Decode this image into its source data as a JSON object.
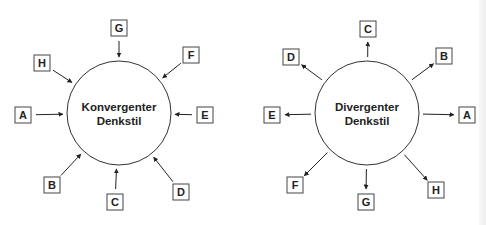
{
  "diagrams": [
    {
      "id": "convergent",
      "title_line1": "Konvergenter",
      "title_line2": "Denkstil",
      "direction": "inward",
      "center": [
        119,
        113
      ],
      "radius": 52,
      "nodes": [
        {
          "label": "A",
          "box": [
            15,
            107
          ]
        },
        {
          "label": "B",
          "box": [
            44,
            177
          ]
        },
        {
          "label": "C",
          "box": [
            107,
            194
          ]
        },
        {
          "label": "D",
          "box": [
            173,
            184
          ]
        },
        {
          "label": "E",
          "box": [
            197,
            107
          ]
        },
        {
          "label": "F",
          "box": [
            183,
            47
          ]
        },
        {
          "label": "G",
          "box": [
            111,
            20
          ]
        },
        {
          "label": "H",
          "box": [
            34,
            55
          ]
        }
      ]
    },
    {
      "id": "divergent",
      "title_line1": "Divergenter",
      "title_line2": "Denkstil",
      "direction": "outward",
      "center": [
        367,
        113
      ],
      "radius": 52,
      "nodes": [
        {
          "label": "A",
          "box": [
            459,
            107
          ]
        },
        {
          "label": "B",
          "box": [
            436,
            48
          ]
        },
        {
          "label": "C",
          "box": [
            360,
            21
          ]
        },
        {
          "label": "D",
          "box": [
            283,
            49
          ]
        },
        {
          "label": "E",
          "box": [
            264,
            107
          ]
        },
        {
          "label": "F",
          "box": [
            287,
            177
          ]
        },
        {
          "label": "G",
          "box": [
            358,
            194
          ]
        },
        {
          "label": "H",
          "box": [
            428,
            182
          ]
        }
      ]
    }
  ],
  "colors": {
    "stroke": "#333333",
    "box_border": "#444444",
    "text": "#222222",
    "background": "#ffffff"
  }
}
